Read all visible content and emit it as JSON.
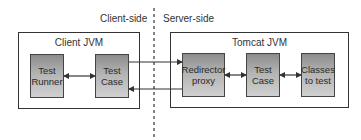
{
  "diagram": {
    "regions": {
      "client_side": "Client-side",
      "server_side": "Server-side"
    },
    "containers": {
      "client_jvm": {
        "label": "Client JVM",
        "components": {
          "test_runner": "Test\nRunner",
          "test_case": "Test\nCase"
        }
      },
      "tomcat_jvm": {
        "label": "Tomcat JVM",
        "components": {
          "redirector_proxy": "Redirector\nproxy",
          "test_case": "Test\nCase",
          "classes_to_test": "Classes\nto test"
        }
      }
    },
    "edges": [
      {
        "from": "Test Runner",
        "to": "Test Case (client)",
        "type": "bidirectional"
      },
      {
        "from": "Test Case (client)",
        "to": "Redirector proxy",
        "type": "request"
      },
      {
        "from": "Redirector proxy",
        "to": "Test Case (client)",
        "type": "response"
      },
      {
        "from": "Redirector proxy",
        "to": "Test Case (server)",
        "type": "bidirectional"
      },
      {
        "from": "Test Case (server)",
        "to": "Classes to test",
        "type": "bidirectional"
      }
    ],
    "colors": {
      "line": "#333333",
      "box_top": "#8c8c8c",
      "box_bottom": "#d0d0d0"
    }
  }
}
